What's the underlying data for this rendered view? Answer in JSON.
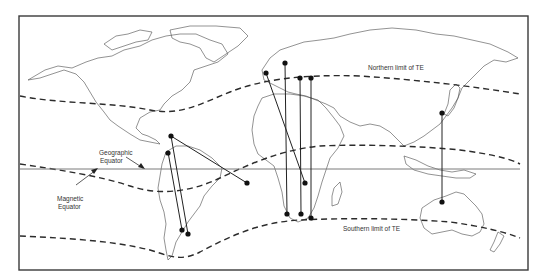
{
  "figure": {
    "type": "world-map",
    "labels": {
      "northern_limit": "Northern limit of TE",
      "southern_limit": "Southern limit of TE",
      "geographic_equator_line1": "Geographic",
      "geographic_equator_line2": "Equator",
      "magnetic_equator_line1": "Magnetic",
      "magnetic_equator_line2": "Equator"
    },
    "colors": {
      "frame": "#3a3a3a",
      "coastline": "#4a4a4a",
      "limit_curves": "#2b2b2b",
      "geographic_equator": "#7a7a7a",
      "paths": "#222222"
    },
    "curves": [
      {
        "name": "northern-limit-of-te",
        "style": "dashed"
      },
      {
        "name": "magnetic-equator",
        "style": "dashed"
      },
      {
        "name": "southern-limit-of-te",
        "style": "dashed"
      },
      {
        "name": "geographic-equator",
        "style": "solid"
      }
    ],
    "propagation_paths": [
      {
        "id": "caribbean-to-south-atlantic",
        "from_region": "Caribbean",
        "to_region": "South Atlantic"
      },
      {
        "id": "venezuela-to-argentina-1",
        "from_region": "Venezuela",
        "to_region": "Argentina"
      },
      {
        "id": "caribbean-to-argentina-2",
        "from_region": "Caribbean",
        "to_region": "Argentina"
      },
      {
        "id": "spain-to-southern-africa",
        "from_region": "Spain",
        "to_region": "Zambia"
      },
      {
        "id": "italy-to-south-africa",
        "from_region": "Italy",
        "to_region": "South Africa"
      },
      {
        "id": "greece-to-south-africa",
        "from_region": "Greece",
        "to_region": "South Africa"
      },
      {
        "id": "cyprus-to-south-africa",
        "from_region": "Cyprus",
        "to_region": "South Africa"
      },
      {
        "id": "japan-to-australia",
        "from_region": "Japan",
        "to_region": "Australia"
      }
    ]
  }
}
